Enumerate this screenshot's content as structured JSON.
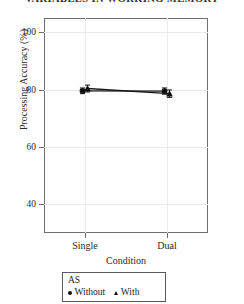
{
  "running_head": "VARIABLES IN WORKING MEMORY",
  "legend": {
    "title": "AS",
    "entries": [
      {
        "label": "Without",
        "marker": "circle-marker"
      },
      {
        "label": "With",
        "marker": "triangle-marker"
      }
    ]
  },
  "chart_data": {
    "type": "line",
    "title": "",
    "subtitle": "",
    "xlabel": "Condition",
    "ylabel": "Processing Accuracy (%)",
    "categories": [
      "Single",
      "Dual"
    ],
    "ylim": [
      30,
      105
    ],
    "yticks": [
      40,
      60,
      80,
      100
    ],
    "ytick_labels": [
      "40",
      "60",
      "80",
      "100"
    ],
    "grid": true,
    "legend_position": "below-plot",
    "series": [
      {
        "name": "Without",
        "marker": "circle",
        "values": [
          79.6,
          79.5
        ],
        "errors": [
          1.0,
          1.1
        ]
      },
      {
        "name": "With",
        "marker": "triangle",
        "values": [
          80.4,
          78.6
        ],
        "errors": [
          1.2,
          1.3
        ]
      }
    ]
  }
}
